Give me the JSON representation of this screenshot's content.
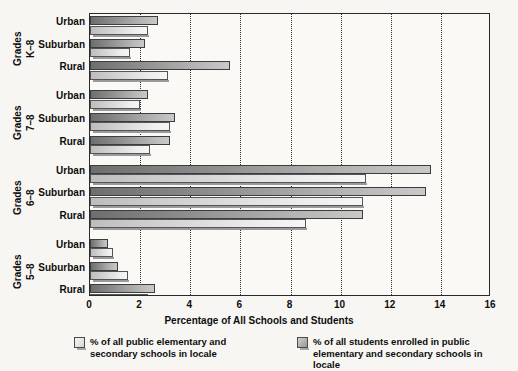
{
  "chart_data": {
    "type": "bar",
    "orientation": "horizontal",
    "title": "",
    "xlabel": "Percentage of All Schools and Students",
    "ylabel": "",
    "xlim": [
      0,
      16
    ],
    "xticks": [
      0,
      2,
      4,
      6,
      8,
      10,
      12,
      14,
      16
    ],
    "grid": true,
    "legend_position": "bottom",
    "series": [
      {
        "name": "% of all public elementary and secondary schools in locale",
        "key": "schools",
        "color": "#e3e3e3"
      },
      {
        "name": "% of all students enrolled in public elementary and secondary schools in locale",
        "key": "students",
        "color": "#9a9a9a"
      }
    ],
    "groups": [
      {
        "label": "Grades",
        "sublabel": "K–8",
        "categories": [
          "Urban",
          "Suburban",
          "Rural"
        ],
        "students": [
          2.7,
          2.2,
          5.6
        ],
        "schools": [
          2.3,
          1.6,
          3.1
        ]
      },
      {
        "label": "Grades",
        "sublabel": "7–8",
        "categories": [
          "Urban",
          "Suburban",
          "Rural"
        ],
        "students": [
          2.3,
          3.4,
          3.2
        ],
        "schools": [
          2.0,
          3.2,
          2.4
        ]
      },
      {
        "label": "Grades",
        "sublabel": "6–8",
        "categories": [
          "Urban",
          "Suburban",
          "Rural"
        ],
        "students": [
          13.6,
          13.4,
          10.9
        ],
        "schools": [
          11.0,
          10.9,
          8.6
        ]
      },
      {
        "label": "Grades",
        "sublabel": "5–8",
        "categories": [
          "Urban",
          "Suburban",
          "Rural"
        ],
        "students": [
          0.7,
          1.1,
          2.6
        ],
        "schools": [
          0.9,
          1.5,
          2.3
        ]
      }
    ]
  },
  "axis": {
    "x_title": "Percentage of All Schools and Students",
    "tick_labels": [
      "0",
      "2",
      "4",
      "6",
      "8",
      "10",
      "12",
      "14",
      "16"
    ]
  },
  "legend": {
    "items": [
      {
        "label": "% of all public elementary and\nsecondary schools in locale",
        "line1": "% of all public elementary and",
        "line2": "secondary schools in locale",
        "swatch": "schools-swatch"
      },
      {
        "label": "% of all students enrolled in public\nelementary and secondary schools in locale",
        "line1": "% of all students enrolled in public",
        "line2": "elementary and secondary schools in locale",
        "swatch": "students-swatch"
      }
    ]
  }
}
